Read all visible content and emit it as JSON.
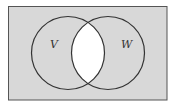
{
  "diagram": {
    "type": "venn",
    "universe": {
      "x": 8.5,
      "y": 6.5,
      "width": 158.5,
      "height": 93.5,
      "fill": "#d8d8d8",
      "stroke": "#555555"
    },
    "sets": [
      {
        "label": "V",
        "cx": 68,
        "cy": 53,
        "r": 36.5,
        "label_x": 50,
        "label_y": 48
      },
      {
        "label": "W",
        "cx": 108,
        "cy": 53,
        "r": 36.5,
        "label_x": 121,
        "label_y": 48
      }
    ],
    "shaded_region": "complement of V ∩ W",
    "intersection_fill": "#ffffff",
    "stroke_color": "#333333"
  }
}
